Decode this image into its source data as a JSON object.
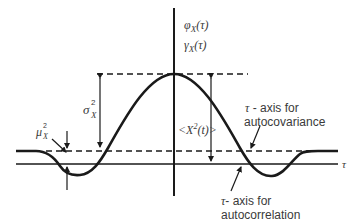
{
  "diagram": {
    "title_labels": {
      "phi": "φ",
      "phi_sub": "X",
      "phi_arg": "(τ)",
      "gamma": "γ",
      "gamma_sub": "X",
      "gamma_arg": "(τ)"
    },
    "sigma_label": {
      "base": "σ",
      "sup": "2",
      "sub": "X"
    },
    "mu_label": {
      "base": "μ",
      "sup": "2",
      "sub": "X"
    },
    "mean_square_label": {
      "open": "<",
      "var": "X",
      "sup": "2",
      "arg": "(t)",
      "close": ">"
    },
    "tau_axis_label": "τ",
    "annotation_autocovariance": {
      "tau": "τ",
      "line1": " - axis for",
      "line2": "autocovariance"
    },
    "annotation_autocorrelation": {
      "tau": "τ",
      "line1": "- axis for",
      "line2": "autocorrelation"
    },
    "colors": {
      "ink": "#1a1a1a",
      "text": "#3a3a3a",
      "background": "#ffffff"
    }
  }
}
